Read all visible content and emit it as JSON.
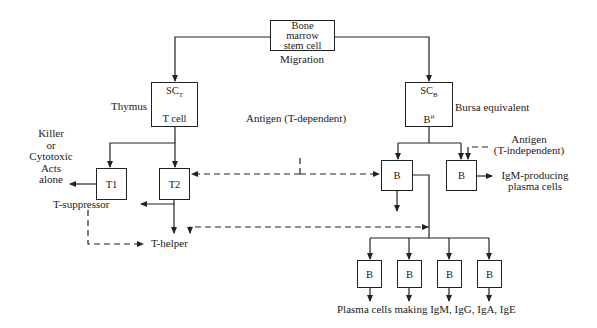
{
  "diagram": {
    "nodes": {
      "stem_cell": {
        "lines": [
          "Bone",
          "marrow",
          "stem cell"
        ]
      },
      "migration": "Migration",
      "sct": {
        "top": "SC",
        "top_sub": "T",
        "bottom": "T cell"
      },
      "scb": {
        "top": "SC",
        "top_sub": "B",
        "bottom": "B",
        "bottom_sup": "μ"
      },
      "thymus": "Thymus",
      "bursa": "Bursa equivalent",
      "t1": "T1",
      "t2": "T2",
      "b_left": "B",
      "b_right": "B",
      "b_bottom": [
        "B",
        "B",
        "B",
        "B"
      ]
    },
    "labels": {
      "killer": [
        "Killer",
        "or",
        "Cytotoxic",
        "Acts",
        "alone"
      ],
      "antigen_t_dep": "Antigen (T-dependent)",
      "antigen_t_indep": [
        "Antigen",
        "(T-independent)"
      ],
      "igm_producing": [
        "IgM-producing",
        "plasma cells"
      ],
      "t_suppressor": "T-suppressor",
      "t_helper": "T-helper",
      "plasma_cells": "Plasma cells making IgM, IgG, IgA, IgE"
    },
    "colors": {
      "line": "#222222",
      "background": "#ffffff"
    }
  }
}
